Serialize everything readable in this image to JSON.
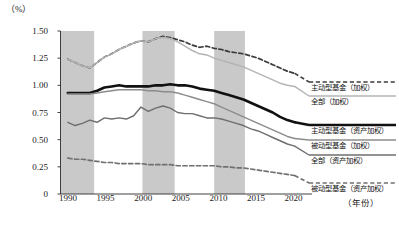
{
  "chart_data": {
    "type": "line",
    "title": "",
    "xlabel": "（年份）",
    "ylabel": "（%）",
    "xlim": [
      1989,
      2022
    ],
    "ylim": [
      0,
      1.5
    ],
    "grid": false,
    "legend_position": "right-inline",
    "y_ticks": [
      "0",
      "0.25",
      "0.50",
      "0.75",
      "1.00",
      "1.25",
      "1.50"
    ],
    "y_tick_values": [
      0,
      0.25,
      0.5,
      0.75,
      1.0,
      1.25,
      1.5
    ],
    "x_ticks": [
      "1990",
      "1995",
      "2000",
      "2005",
      "2010",
      "2015",
      "2020"
    ],
    "x_tick_values": [
      1990,
      1995,
      2000,
      2005,
      2010,
      2015,
      2020
    ],
    "shaded_bands": [
      {
        "start": 1989,
        "end": 1993.6
      },
      {
        "start": 2000.2,
        "end": 2004.6
      },
      {
        "start": 2010.0,
        "end": 2014.2
      }
    ],
    "shade_color": "#c9c9c9",
    "x": [
      1990,
      1991,
      1992,
      1993,
      1994,
      1995,
      1996,
      1997,
      1998,
      1999,
      2000,
      2001,
      2002,
      2003,
      2004,
      2005,
      2006,
      2007,
      2008,
      2009,
      2010,
      2011,
      2012,
      2013,
      2014,
      2015,
      2016,
      2017,
      2018,
      2019,
      2020,
      2021
    ],
    "series": [
      {
        "name": "主动型基金（加权）",
        "style": "dashed",
        "color": "#3c3c3c",
        "width": 1.7,
        "values": [
          1.24,
          1.21,
          1.18,
          1.16,
          1.21,
          1.26,
          1.29,
          1.33,
          1.36,
          1.39,
          1.41,
          1.4,
          1.43,
          1.45,
          1.44,
          1.42,
          1.4,
          1.37,
          1.35,
          1.36,
          1.34,
          1.33,
          1.31,
          1.3,
          1.29,
          1.27,
          1.25,
          1.22,
          1.19,
          1.16,
          1.13,
          1.11
        ]
      },
      {
        "name": "全部（加权）",
        "style": "solid",
        "color": "#b4b4b4",
        "width": 1.5,
        "values": [
          1.24,
          1.21,
          1.18,
          1.16,
          1.21,
          1.26,
          1.29,
          1.33,
          1.36,
          1.39,
          1.41,
          1.4,
          1.43,
          1.44,
          1.43,
          1.4,
          1.36,
          1.32,
          1.29,
          1.28,
          1.25,
          1.23,
          1.21,
          1.19,
          1.17,
          1.14,
          1.11,
          1.08,
          1.05,
          1.02,
          1.0,
          0.99
        ]
      },
      {
        "name": "主动型基金（资产加权）",
        "style": "solid",
        "color": "#111111",
        "width": 2.6,
        "values": [
          0.93,
          0.93,
          0.93,
          0.93,
          0.95,
          0.98,
          0.99,
          1.0,
          0.99,
          0.99,
          0.99,
          0.99,
          1.0,
          1.0,
          1.01,
          1.0,
          1.0,
          0.99,
          0.97,
          0.96,
          0.95,
          0.93,
          0.91,
          0.89,
          0.87,
          0.84,
          0.81,
          0.78,
          0.75,
          0.71,
          0.68,
          0.66
        ]
      },
      {
        "name": "被动型基金（加权）",
        "style": "solid",
        "color": "#8c8c8c",
        "width": 1.5,
        "values": [
          0.92,
          0.92,
          0.92,
          0.92,
          0.93,
          0.94,
          0.95,
          0.96,
          0.96,
          0.96,
          0.96,
          0.95,
          0.95,
          0.94,
          0.94,
          0.93,
          0.91,
          0.89,
          0.87,
          0.85,
          0.83,
          0.8,
          0.77,
          0.74,
          0.71,
          0.68,
          0.65,
          0.62,
          0.59,
          0.56,
          0.53,
          0.51
        ]
      },
      {
        "name": "全部（资产加权）",
        "style": "solid",
        "color": "#6e6e6e",
        "width": 1.4,
        "values": [
          0.66,
          0.63,
          0.65,
          0.68,
          0.66,
          0.7,
          0.69,
          0.7,
          0.69,
          0.72,
          0.8,
          0.76,
          0.79,
          0.81,
          0.79,
          0.75,
          0.74,
          0.74,
          0.72,
          0.7,
          0.7,
          0.69,
          0.67,
          0.65,
          0.63,
          0.6,
          0.58,
          0.55,
          0.52,
          0.49,
          0.46,
          0.44
        ]
      },
      {
        "name": "被动型基金（资产加权）",
        "style": "dashed",
        "color": "#707070",
        "width": 1.7,
        "values": [
          0.33,
          0.32,
          0.32,
          0.31,
          0.3,
          0.29,
          0.29,
          0.28,
          0.28,
          0.28,
          0.28,
          0.27,
          0.27,
          0.27,
          0.27,
          0.26,
          0.26,
          0.26,
          0.26,
          0.26,
          0.26,
          0.25,
          0.25,
          0.24,
          0.24,
          0.23,
          0.22,
          0.21,
          0.2,
          0.19,
          0.18,
          0.17
        ]
      }
    ],
    "legend_labels": [
      "主动型基金（加权）",
      "全部（加权）",
      "主动型基金（资产加权）",
      "被动型基金（加权）",
      "全部（资产加权）",
      "被动型基金（资产加权）"
    ]
  }
}
